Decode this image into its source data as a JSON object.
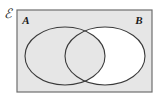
{
  "figure": {
    "kind": "venn-diagram",
    "universe_symbol": "ℰ",
    "universe_symbol_name": "script-capital-e",
    "background_color": "#ffffff",
    "rectangle": {
      "name": "universal-set-rectangle",
      "x": 17,
      "y": 10,
      "width": 135,
      "height": 82,
      "fill": "#e6e6e6",
      "stroke": "#6e6e6e",
      "stroke_width": 1.2
    },
    "sets": [
      {
        "label": "A",
        "name": "set-a",
        "cx": 65,
        "cy": 56,
        "rx": 40,
        "ry": 29,
        "label_x": 26,
        "label_y": 24,
        "stroke": "#3a3a3a",
        "stroke_width": 1.1,
        "shaded": true
      },
      {
        "label": "B",
        "name": "set-b",
        "cx": 105,
        "cy": 56,
        "rx": 40,
        "ry": 29,
        "label_x": 139,
        "label_y": 24,
        "stroke": "#3a3a3a",
        "stroke_width": 1.1,
        "shaded": false
      }
    ],
    "universe_label_x": 4,
    "universe_label_y": 18,
    "shading": {
      "name": "shaded-region",
      "description": "Everything except the part of B that lies outside A",
      "fill": "#e6e6e6",
      "unshaded_fill": "#ffffff",
      "unshaded_region": "B minus A"
    }
  }
}
